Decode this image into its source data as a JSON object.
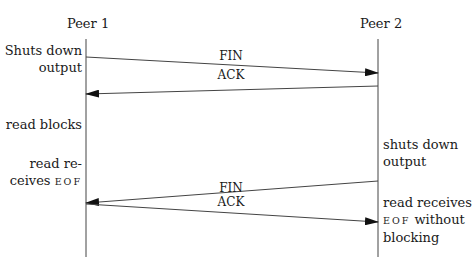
{
  "diagram": {
    "type": "sequence",
    "participants": [
      {
        "id": "peer1",
        "label": "Peer 1",
        "x": 86
      },
      {
        "id": "peer2",
        "label": "Peer 2",
        "x": 378
      }
    ],
    "messages": [
      {
        "label": "FIN",
        "from": "peer1",
        "to": "peer2"
      },
      {
        "label": "ACK",
        "from": "peer2",
        "to": "peer1"
      },
      {
        "label": "FIN",
        "from": "peer2",
        "to": "peer1"
      },
      {
        "label": "ACK",
        "from": "peer1",
        "to": "peer2"
      }
    ],
    "peer1_notes": [
      {
        "lines": [
          "Shuts down",
          "output"
        ]
      },
      {
        "lines": [
          "read blocks"
        ]
      },
      {
        "lines": [
          "read re-",
          "ceives"
        ],
        "smallcaps": "EOF"
      }
    ],
    "peer2_notes": [
      {
        "lines": [
          "shuts down",
          "output"
        ]
      },
      {
        "lines": [
          "read receives",
          "without",
          "blocking"
        ],
        "smallcaps": "EOF"
      }
    ]
  }
}
